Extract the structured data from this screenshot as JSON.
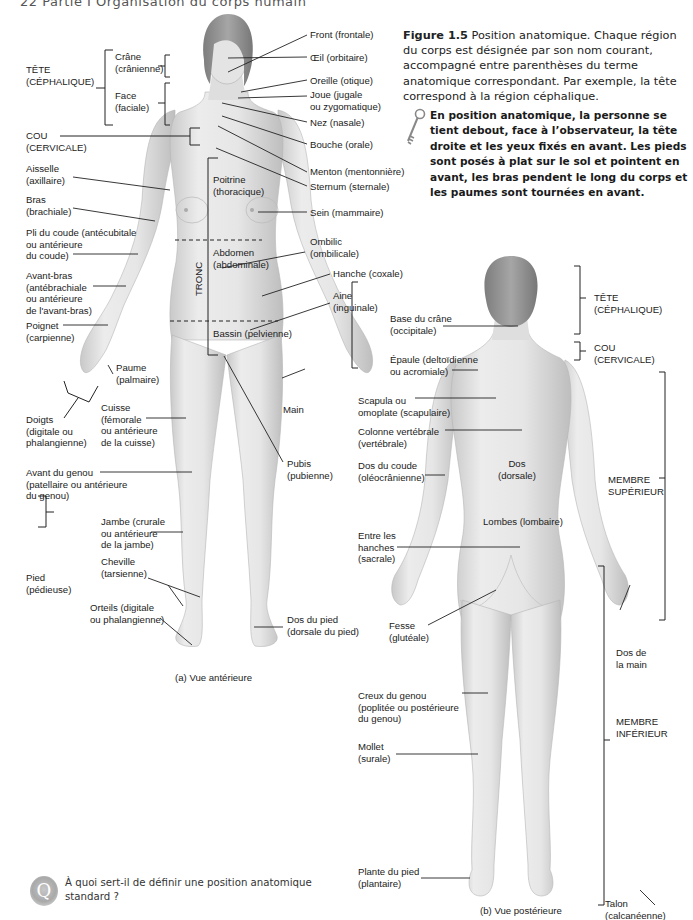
{
  "page": {
    "running_head": "22   Partie I  Organisation du corps humain"
  },
  "caption": {
    "figure_number": "Figure 1.5",
    "text": "Position anatomique. Chaque région du corps est désignée par son nom courant, accompagné entre parenthèses du terme anatomique correspondant. Par exemple, la tête correspond à la région céphalique."
  },
  "key_note": {
    "icon": "key-icon",
    "text": "En position anatomique, la personne se tient debout, face à l’observateur, la tête droite et les yeux fixés en avant. Les pieds sont posés à plat sur le sol et pointent en avant, les bras pendent le long du corps et les paumes sont tournées en avant."
  },
  "anterior_view": {
    "caption": "(a) Vue antérieure",
    "left_labels": {
      "tete": "TÊTE\n(CÉPHALIQUE)",
      "crane": "Crâne\n(crânienne)",
      "face": "Face\n(faciale)",
      "cou": "COU\n(CERVICALE)",
      "aisselle": "Aisselle\n(axillaire)",
      "bras": "Bras\n(brachiale)",
      "pli_coude": "Pli du coude (antécubitale\nou antérieure\ndu coude)",
      "avant_bras": "Avant-bras\n(antébrachiale\nou antérieure\nde l'avant-bras)",
      "poignet": "Poignet\n(carpienne)",
      "paume": "Paume\n(palmaire)",
      "doigts": "Doigts\n(digitale ou\nphalangienne)",
      "cuisse": "Cuisse\n(fémorale\nou antérieure\nde la cuisse)",
      "avant_genou": "Avant du genou\n(patellaire ou antérieure\ndu genou)",
      "jambe": "Jambe (crurale\nou antérieure\nde la jambe)",
      "pied": "Pied\n(pédieuse)",
      "cheville": "Cheville\n(tarsienne)",
      "orteils": "Orteils (digitale\nou phalangienne)"
    },
    "inner_labels": {
      "poitrine": "Poitrine\n(thoracique)",
      "abdomen": "Abdomen\n(abdominale)",
      "tronc": "TRONC",
      "bassin": "Bassin (pelvienne)"
    },
    "right_labels": {
      "front": "Front (frontale)",
      "oeil": "Œil (orbitaire)",
      "oreille": "Oreille (otique)",
      "joue": "Joue (jugale\nou zygomatique)",
      "nez": "Nez (nasale)",
      "bouche": "Bouche (orale)",
      "menton": "Menton (mentonnière)",
      "sternum": "Sternum (sternale)",
      "sein": "Sein (mammaire)",
      "ombilic": "Ombilic\n(ombilicale)",
      "hanche": "Hanche (coxale)",
      "aine": "Aine\n(inguinale)",
      "main": "Main",
      "pubis": "Pubis\n(pubienne)",
      "dos_pied": "Dos du pied\n(dorsale du pied)"
    }
  },
  "posterior_view": {
    "caption": "(b) Vue postérieure",
    "left_labels": {
      "base_crane": "Base du crâne\n(occipitale)",
      "epaule": "Épaule (deltoïdienne\nou acromiale)",
      "scapula": "Scapula ou\nomoplate (scapulaire)",
      "colonne": "Colonne vertébrale\n(vertébrale)",
      "dos_coude": "Dos du coude\n(oléocrânienne)",
      "entre_hanches": "Entre les\nhanches\n(sacrale)",
      "fesse": "Fesse\n(glutéale)",
      "creux_genou": "Creux du genou\n(poplitée ou postérieure\ndu genou)",
      "mollet": "Mollet\n(surale)",
      "plante_pied": "Plante du pied\n(plantaire)"
    },
    "inner_labels": {
      "dos": "Dos\n(dorsale)",
      "lombes": "Lombes (lombaire)"
    },
    "right_labels": {
      "tete": "TÊTE\n(CÉPHALIQUE)",
      "cou": "COU\n(CERVICALE)",
      "membre_sup": "MEMBRE\nSUPÉRIEUR",
      "dos_main": "Dos de\nla main",
      "membre_inf": "MEMBRE\nINFÉRIEUR",
      "talon": "Talon\n(calcanéenne)"
    }
  },
  "question": {
    "icon_letter": "Q",
    "text": "À quoi sert-il de définir une position anatomique standard ?"
  },
  "colors": {
    "skin_light": "#eeeeee",
    "skin_mid": "#d6d6d6",
    "skin_shadow": "#bdbdbd",
    "hair": "#8c8c8c",
    "leader_line": "#222222"
  }
}
